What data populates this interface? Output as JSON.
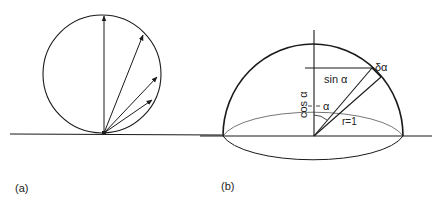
{
  "panels": {
    "a": {
      "label": "(a)",
      "description": "circle tangent to a surface with vectors from contact point"
    },
    "b": {
      "label": "(b)",
      "description": "hemisphere of unit radius with angle geometry",
      "labels": {
        "sin": "sin α",
        "cos": "cos α",
        "alpha": "α",
        "delta_alpha": "δα",
        "radius": "r=1"
      }
    }
  },
  "colors": {
    "stroke": "#1a1a1a",
    "background": "#ffffff"
  }
}
